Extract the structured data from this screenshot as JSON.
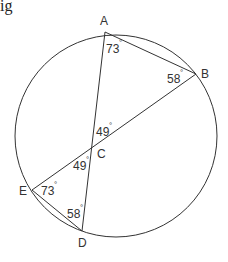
{
  "partial_text": "ig",
  "points": {
    "A": "A",
    "B": "B",
    "C": "C",
    "D": "D",
    "E": "E"
  },
  "angles": {
    "A": "73",
    "B": "58",
    "C_upper": "49",
    "C_lower": "49",
    "E": "73",
    "D": "58"
  },
  "degree_symbol": "°",
  "segments": [
    "AB",
    "AD",
    "BE",
    "ED"
  ],
  "stroke_color": "#333333"
}
